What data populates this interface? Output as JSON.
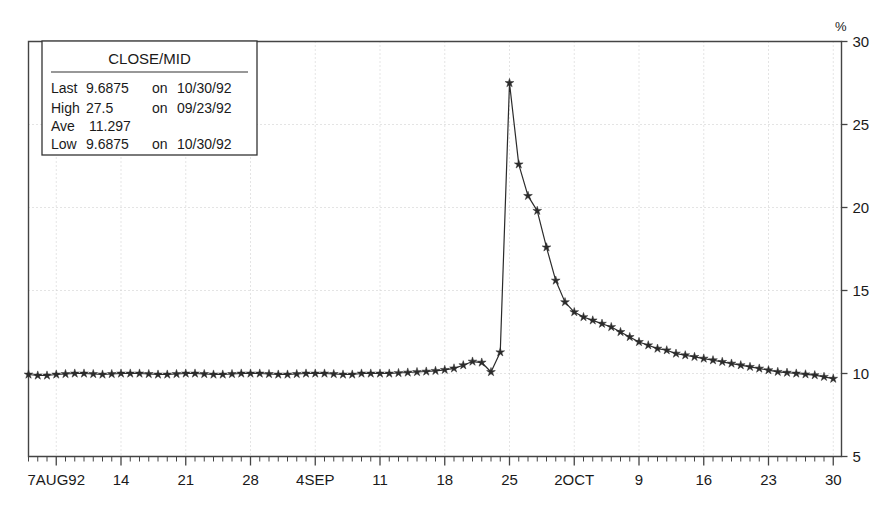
{
  "chart_data": {
    "type": "line",
    "title": "CLOSE/MID",
    "xlabel": "",
    "ylabel": "%",
    "ylim": [
      5,
      30
    ],
    "ytick_labels": [
      "5",
      "10",
      "15",
      "20",
      "25",
      "30"
    ],
    "ytick_values": [
      5,
      10,
      15,
      20,
      25,
      30
    ],
    "xtick_labels": [
      "7AUG92",
      "14",
      "21",
      "28",
      "4SEP",
      "11",
      "18",
      "25",
      "2OCT",
      "9",
      "16",
      "23",
      "30"
    ],
    "xtick_indices": [
      3,
      10,
      17,
      24,
      31,
      38,
      45,
      52,
      59,
      66,
      73,
      80,
      87
    ],
    "grid": "dotted-gray-both-axes",
    "legend_position": "top-left-inset",
    "marker": "star",
    "x": [
      0,
      1,
      2,
      3,
      4,
      5,
      6,
      7,
      8,
      9,
      10,
      11,
      12,
      13,
      14,
      15,
      16,
      17,
      18,
      19,
      20,
      21,
      22,
      23,
      24,
      25,
      26,
      27,
      28,
      29,
      30,
      31,
      32,
      33,
      34,
      35,
      36,
      37,
      38,
      39,
      40,
      41,
      42,
      43,
      44,
      45,
      46,
      47,
      48,
      49,
      50,
      51,
      52,
      53,
      54,
      55,
      56,
      57,
      58,
      59,
      60,
      61,
      62,
      63,
      64,
      65,
      66,
      67,
      68,
      69,
      70,
      71,
      72,
      73,
      74,
      75,
      76,
      77,
      78,
      79,
      80,
      81,
      82,
      83,
      84,
      85,
      86,
      87
    ],
    "values": [
      9.94,
      9.88,
      9.88,
      9.94,
      9.97,
      10.0,
      10.0,
      9.97,
      9.94,
      9.97,
      10.0,
      10.0,
      10.0,
      9.97,
      9.94,
      9.94,
      9.97,
      10.0,
      10.0,
      9.97,
      9.94,
      9.94,
      9.97,
      10.0,
      10.0,
      10.0,
      9.97,
      9.94,
      9.94,
      9.97,
      10.0,
      10.0,
      10.0,
      9.97,
      9.94,
      9.94,
      10.0,
      10.0,
      10.0,
      10.0,
      10.03,
      10.06,
      10.09,
      10.12,
      10.16,
      10.22,
      10.31,
      10.5,
      10.72,
      10.66,
      10.09,
      11.28,
      27.5,
      22.6,
      20.7,
      19.8,
      17.6,
      15.6,
      14.3,
      13.7,
      13.4,
      13.2,
      13.0,
      12.8,
      12.5,
      12.2,
      11.9,
      11.7,
      11.5,
      11.4,
      11.2,
      11.1,
      11.0,
      10.9,
      10.8,
      10.7,
      10.6,
      10.5,
      10.4,
      10.3,
      10.2,
      10.1,
      10.05,
      10.0,
      9.95,
      9.9,
      9.8,
      9.6875
    ],
    "annotations": []
  },
  "legend": {
    "title": "CLOSE/MID",
    "rows": [
      {
        "label": "Last",
        "value": "9.6875",
        "on": "on",
        "date": "10/30/92"
      },
      {
        "label": "High",
        "value": "27.5",
        "on": "on",
        "date": "09/23/92"
      },
      {
        "label": "Ave",
        "value": "11.297",
        "on": "",
        "date": ""
      },
      {
        "label": "Low",
        "value": "9.6875",
        "on": "on",
        "date": "10/30/92"
      }
    ]
  },
  "axis": {
    "unit": "%"
  },
  "colors": {
    "line": "#2b2b2b",
    "frame": "#444444",
    "grid": "#c9c9c9",
    "text": "#1a1a1a",
    "background": "#ffffff"
  }
}
